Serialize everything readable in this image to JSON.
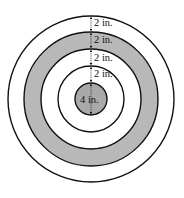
{
  "diagram": {
    "type": "concentric-circles-target",
    "center": [
      91,
      99
    ],
    "colors": {
      "stroke": "#111111",
      "shaded": "#b8b8b8",
      "center_fill": "#a9a9a9",
      "background": "#ffffff"
    },
    "rings": [
      {
        "name": "outer-ring",
        "radius": 83,
        "fill": "#ffffff"
      },
      {
        "name": "shaded-ring",
        "radius": 67,
        "fill": "#b8b8b8"
      },
      {
        "name": "third-ring",
        "radius": 50,
        "fill": "#ffffff"
      },
      {
        "name": "fourth-ring",
        "radius": 33,
        "fill": "#ffffff"
      },
      {
        "name": "center-circle",
        "radius": 16,
        "fill": "#a9a9a9"
      }
    ],
    "labels": {
      "gap1": "2 in.",
      "gap2": "2 in.",
      "gap3": "2 in.",
      "gap4": "2 in.",
      "center": "4 in."
    }
  }
}
